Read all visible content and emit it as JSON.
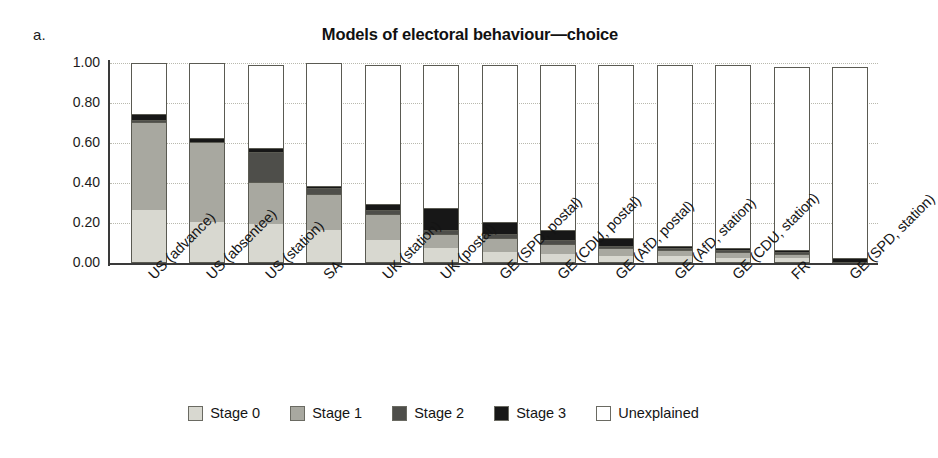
{
  "panel": {
    "letter": "a."
  },
  "chart_data": {
    "type": "bar",
    "subtype": "stacked-vertical",
    "title": "Models of electoral behaviour—choice",
    "xlabel": "",
    "ylabel": "",
    "ylim": [
      0.0,
      1.0
    ],
    "yticks": [
      "0.00",
      "0.20",
      "0.40",
      "0.60",
      "0.80",
      "1.00"
    ],
    "ytick_values": [
      0.0,
      0.2,
      0.4,
      0.6,
      0.8,
      1.0
    ],
    "grid": "horizontal-dotted",
    "legend_position": "bottom-center",
    "categories": [
      "US (advance)",
      "US (absentee)",
      "US (station)",
      "SA",
      "UK (station)",
      "UK (postal)",
      "GE (SPD, postal)",
      "GE (CDU, postal)",
      "GE (AfD, postal)",
      "GE (AfD, station)",
      "GE (CDU, station)",
      "FR",
      "GE (SPD, station)"
    ],
    "series": [
      {
        "name": "Stage 0",
        "color": "#d8d8d0",
        "values": [
          0.26,
          0.2,
          0.19,
          0.16,
          0.11,
          0.07,
          0.05,
          0.04,
          0.03,
          0.03,
          0.02,
          0.02,
          0.0
        ]
      },
      {
        "name": "Stage 1",
        "color": "#a8a8a0",
        "values": [
          0.44,
          0.4,
          0.21,
          0.18,
          0.13,
          0.07,
          0.07,
          0.05,
          0.04,
          0.03,
          0.03,
          0.02,
          0.0
        ]
      },
      {
        "name": "Stage 2",
        "color": "#4e4e4a",
        "values": [
          0.01,
          0.0,
          0.15,
          0.03,
          0.02,
          0.02,
          0.02,
          0.02,
          0.01,
          0.01,
          0.01,
          0.01,
          0.0
        ]
      },
      {
        "name": "Stage 3",
        "color": "#171717",
        "values": [
          0.03,
          0.02,
          0.02,
          0.01,
          0.03,
          0.11,
          0.06,
          0.05,
          0.04,
          0.01,
          0.01,
          0.01,
          0.02
        ]
      },
      {
        "name": "Unexplained",
        "color": "#ffffff",
        "values": [
          0.26,
          0.38,
          0.42,
          0.62,
          0.7,
          0.72,
          0.79,
          0.83,
          0.87,
          0.91,
          0.92,
          0.92,
          0.96
        ]
      }
    ],
    "totals": [
      1.0,
      1.0,
      0.99,
      1.0,
      0.99,
      0.99,
      0.99,
      0.99,
      0.99,
      0.99,
      0.99,
      0.98,
      0.98
    ]
  },
  "legend": {
    "items": [
      {
        "label": "Stage 0",
        "color": "#d8d8d0"
      },
      {
        "label": "Stage 1",
        "color": "#a8a8a0"
      },
      {
        "label": "Stage 2",
        "color": "#4e4e4a"
      },
      {
        "label": "Stage 3",
        "color": "#171717"
      },
      {
        "label": "Unexplained",
        "color": "#ffffff"
      }
    ]
  }
}
